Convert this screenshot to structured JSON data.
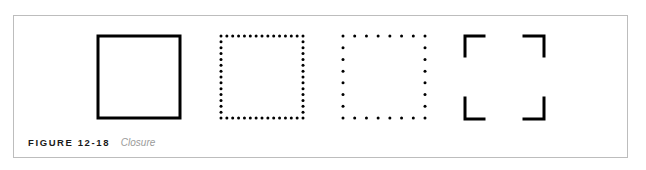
{
  "figure": {
    "label": "FIGURE 12-18",
    "title": "Closure",
    "shapes": [
      {
        "name": "solid-square",
        "style": "solid"
      },
      {
        "name": "dense-dotted-square",
        "style": "dotted-dense"
      },
      {
        "name": "sparse-dotted-square",
        "style": "dotted-sparse"
      },
      {
        "name": "corner-brackets-square",
        "style": "corners"
      }
    ],
    "stroke_color": "#000000",
    "frame_color": "#bdbdbd"
  }
}
